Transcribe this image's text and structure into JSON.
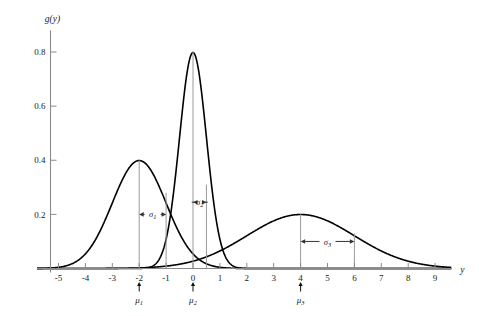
{
  "chart_data": {
    "type": "line",
    "title": "",
    "subtitle": "",
    "xlabel": "y",
    "ylabel": "g(y)",
    "xlim": [
      -5.8,
      9.6
    ],
    "ylim": [
      0,
      0.88
    ],
    "grid": false,
    "legend_position": "none",
    "x_ticks": [
      "-5",
      "-4",
      "-3",
      "-2",
      "-1",
      "0",
      "1",
      "2",
      "3",
      "4",
      "5",
      "6",
      "7",
      "8",
      "9"
    ],
    "x_tick_values": [
      -5,
      -4,
      -3,
      -2,
      -1,
      0,
      1,
      2,
      3,
      4,
      5,
      6,
      7,
      8,
      9
    ],
    "y_ticks": [
      "0.2",
      "0.4",
      "0.6",
      "0.8"
    ],
    "y_tick_values": [
      0.2,
      0.4,
      0.6,
      0.8
    ],
    "series": [
      {
        "name": "g1",
        "distribution": "normal",
        "mean": -2,
        "sigma": 1,
        "peak_value": 0.4,
        "peak_x": -2,
        "color": "#000000"
      },
      {
        "name": "g2",
        "distribution": "normal",
        "mean": 0,
        "sigma": 0.5,
        "peak_value": 0.8,
        "peak_x": 0,
        "color": "#000000"
      },
      {
        "name": "g3",
        "distribution": "normal",
        "mean": 4,
        "sigma": 2,
        "peak_value": 0.2,
        "peak_x": 4,
        "color": "#000000"
      }
    ],
    "annotations": {
      "mean_markers": [
        {
          "label": "μ",
          "sub": "1",
          "x": -2
        },
        {
          "label": "μ",
          "sub": "2",
          "x": 0
        },
        {
          "label": "μ",
          "sub": "3",
          "x": 4
        }
      ],
      "sigma_spans": [
        {
          "label": "σ",
          "sub": "1",
          "from_x": -2,
          "to_x": -1,
          "y": 0.2
        },
        {
          "label": "σ",
          "sub": "2",
          "from_x": 0,
          "to_x": 0.5,
          "y": 0.245
        },
        {
          "label": "σ",
          "sub": "3",
          "from_x": 4,
          "to_x": 6,
          "y": 0.1
        }
      ],
      "drop_lines": [
        {
          "x": -2,
          "to_y": 0.4
        },
        {
          "x": -1,
          "to_y": 0.28
        },
        {
          "x": 0,
          "to_y": 0.8
        },
        {
          "x": 0.5,
          "to_y": 0.31
        },
        {
          "x": 4,
          "to_y": 0.2
        },
        {
          "x": 6,
          "to_y": 0.13
        }
      ]
    },
    "colors": {
      "curve": "#000000",
      "axis": "#8a8a8a",
      "drop_line": "#9a9a9a",
      "annotation": "#333333",
      "text": "#1a1a1a",
      "background": "#ffffff"
    }
  }
}
